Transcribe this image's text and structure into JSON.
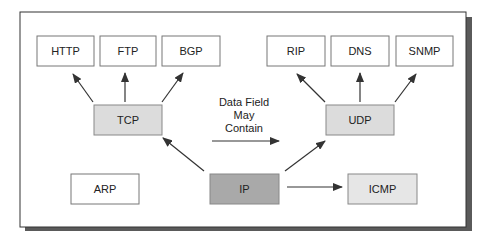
{
  "diagram": {
    "colors": {
      "frame_border": "#333333",
      "frame_shadow": "#555555",
      "box_border": "#777777",
      "box_white": "#ffffff",
      "box_light": "#dcdcdc",
      "box_lighter": "#e6e6e6",
      "box_dark": "#a9a9a9",
      "arrow": "#333333"
    },
    "nodes": {
      "http": {
        "label": "HTTP"
      },
      "ftp": {
        "label": "FTP"
      },
      "bgp": {
        "label": "BGP"
      },
      "rip": {
        "label": "RIP"
      },
      "dns": {
        "label": "DNS"
      },
      "snmp": {
        "label": "SNMP"
      },
      "tcp": {
        "label": "TCP"
      },
      "udp": {
        "label": "UDP"
      },
      "arp": {
        "label": "ARP"
      },
      "ip": {
        "label": "IP"
      },
      "icmp": {
        "label": "ICMP"
      }
    },
    "legend": {
      "line1": "Data Field",
      "line2": "May",
      "line3": "Contain"
    },
    "edges": [
      [
        "tcp",
        "http"
      ],
      [
        "tcp",
        "ftp"
      ],
      [
        "tcp",
        "bgp"
      ],
      [
        "udp",
        "rip"
      ],
      [
        "udp",
        "dns"
      ],
      [
        "udp",
        "snmp"
      ],
      [
        "ip",
        "tcp"
      ],
      [
        "ip",
        "udp"
      ],
      [
        "ip",
        "icmp"
      ]
    ]
  }
}
